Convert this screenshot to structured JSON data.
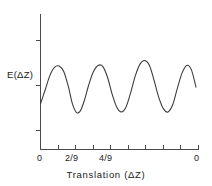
{
  "chart_data": {
    "type": "line",
    "title": "",
    "xlabel": "Translation (ΔZ)",
    "ylabel": "E(ΔZ)",
    "xlim": [
      0,
      1
    ],
    "ylim": [
      0,
      1
    ],
    "grid": false,
    "legend": null,
    "x_tick_labels": [
      "0",
      "2/9",
      "4/9",
      "0"
    ],
    "x_tick_label_positions": [
      0,
      0.2222,
      0.4444,
      1.0
    ],
    "x_tick_count": 10,
    "y_tick_count": 3,
    "series": [
      {
        "name": "E(ΔZ)",
        "color": "#3d3d3d",
        "x": [
          0.0,
          0.03,
          0.06,
          0.09,
          0.12,
          0.15,
          0.18,
          0.205,
          0.23,
          0.255,
          0.28,
          0.31,
          0.34,
          0.37,
          0.4,
          0.43,
          0.46,
          0.49,
          0.52,
          0.55,
          0.58,
          0.61,
          0.64,
          0.67,
          0.7,
          0.73,
          0.76,
          0.79,
          0.82,
          0.85,
          0.88,
          0.91,
          0.94,
          0.97,
          1.0
        ],
        "y": [
          0.33,
          0.455,
          0.585,
          0.66,
          0.672,
          0.62,
          0.48,
          0.33,
          0.252,
          0.262,
          0.35,
          0.5,
          0.62,
          0.678,
          0.67,
          0.575,
          0.42,
          0.3,
          0.255,
          0.3,
          0.43,
          0.585,
          0.69,
          0.722,
          0.68,
          0.545,
          0.39,
          0.285,
          0.255,
          0.32,
          0.47,
          0.608,
          0.678,
          0.64,
          0.48
        ],
        "peaks_x": [
          0.125,
          0.38,
          0.665,
          0.845,
          0.93
        ],
        "troughs_x": [
          0.245,
          0.53,
          0.8
        ]
      }
    ]
  },
  "axes": {
    "y_axis_label": "E(ΔZ)",
    "x_axis_label": "Translation (ΔZ)",
    "tick_labels": {
      "x_origin": "0",
      "x_two_ninths": "2/9",
      "x_four_ninths": "4/9",
      "x_end": "0"
    }
  },
  "colors": {
    "curve": "#3d3d3d",
    "axis": "#4a4a4a",
    "text": "#1a1a1a",
    "background": "#ffffff"
  }
}
